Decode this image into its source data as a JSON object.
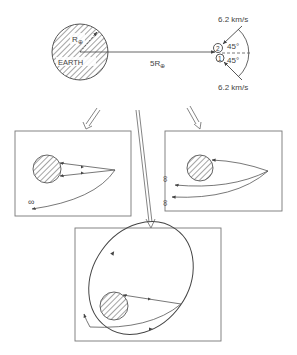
{
  "top": {
    "earth_label": "EARTH",
    "radius_label": "R",
    "radius_sub": "⊕",
    "distance_label": "5R",
    "distance_sub": "⊕",
    "velocity_top": "6.2 km/s",
    "velocity_bottom": "6.2 km/s",
    "angle_top": "45°",
    "angle_bottom": "45°",
    "particle_top": "2",
    "particle_bottom": "1"
  },
  "panels": {
    "left": {
      "infinity_label": "∞"
    },
    "right": {
      "infinity_top": "∞",
      "infinity_bottom": "∞"
    },
    "bottom": {}
  },
  "colors": {
    "line": "#555555",
    "hatch": "#666666",
    "box": "#777777"
  }
}
